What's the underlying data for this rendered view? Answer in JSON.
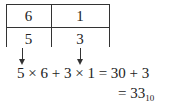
{
  "table": {
    "rows": [
      [
        "6",
        "1"
      ],
      [
        "5",
        "3"
      ]
    ]
  },
  "equation": {
    "line1": "5 × 6 + 3 × 1 = 30 + 3",
    "line2_prefix": "= 33",
    "line2_subscript": "10"
  }
}
